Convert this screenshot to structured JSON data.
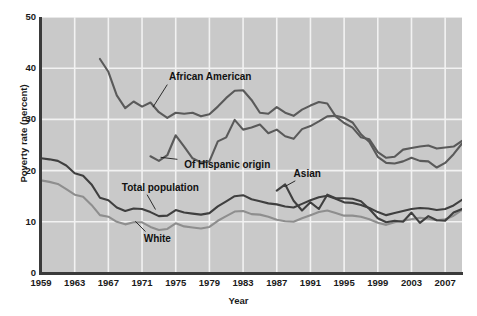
{
  "chart_data": {
    "type": "line",
    "title": "",
    "xlabel": "Year",
    "ylabel": "Poverty rate (percent)",
    "xlim": [
      1959,
      2009
    ],
    "ylim": [
      0,
      50
    ],
    "grid": true,
    "legend_position": "inline-annotations",
    "xticks": [
      1959,
      1963,
      1967,
      1971,
      1975,
      1979,
      1983,
      1987,
      1991,
      1995,
      1999,
      2003,
      2007
    ],
    "yticks": [
      0,
      10,
      20,
      30,
      40,
      50
    ],
    "background_color": "#c9c9c9",
    "gridline_color": "#f2f2f2",
    "series": [
      {
        "name": "African American",
        "color": "#5a5a5a",
        "label_x": 1974.2,
        "label_y": 38.2,
        "x": [
          1966,
          1967,
          1968,
          1969,
          1970,
          1971,
          1972,
          1973,
          1974,
          1975,
          1976,
          1977,
          1978,
          1979,
          1980,
          1981,
          1982,
          1983,
          1984,
          1985,
          1986,
          1987,
          1988,
          1989,
          1990,
          1991,
          1992,
          1993,
          1994,
          1995,
          1996,
          1997,
          1998,
          1999,
          2000,
          2001,
          2002,
          2003,
          2004,
          2005,
          2006,
          2007,
          2008,
          2009
        ],
        "values": [
          41.8,
          39.3,
          34.7,
          32.2,
          33.5,
          32.5,
          33.3,
          31.4,
          30.3,
          31.3,
          31.1,
          31.3,
          30.6,
          31.0,
          32.5,
          34.2,
          35.6,
          35.7,
          33.8,
          31.3,
          31.1,
          32.4,
          31.3,
          30.7,
          31.9,
          32.7,
          33.4,
          33.1,
          30.6,
          29.3,
          28.4,
          26.5,
          26.1,
          23.6,
          22.5,
          22.7,
          24.1,
          24.4,
          24.7,
          24.9,
          24.3,
          24.5,
          24.7,
          25.8
        ]
      },
      {
        "name": "Of Hispanic origin",
        "color": "#5a5a5a",
        "label_x": 1976.0,
        "label_y": 21.0,
        "x": [
          1972,
          1973,
          1974,
          1975,
          1976,
          1977,
          1978,
          1979,
          1980,
          1981,
          1982,
          1983,
          1984,
          1985,
          1986,
          1987,
          1988,
          1989,
          1990,
          1991,
          1992,
          1993,
          1994,
          1995,
          1996,
          1997,
          1998,
          1999,
          2000,
          2001,
          2002,
          2003,
          2004,
          2005,
          2006,
          2007,
          2008,
          2009
        ],
        "values": [
          22.8,
          21.9,
          23.0,
          26.9,
          24.7,
          22.4,
          21.6,
          21.8,
          25.7,
          26.5,
          29.9,
          28.0,
          28.4,
          29.0,
          27.3,
          28.0,
          26.7,
          26.2,
          28.1,
          28.7,
          29.6,
          30.6,
          30.7,
          30.3,
          29.4,
          27.1,
          25.6,
          22.7,
          21.5,
          21.4,
          21.8,
          22.5,
          21.9,
          21.8,
          20.6,
          21.5,
          23.2,
          25.3
        ]
      },
      {
        "name": "Total population",
        "color": "#3f3f3f",
        "label_x": 1968.6,
        "label_y": 16.6,
        "x": [
          1959,
          1960,
          1961,
          1962,
          1963,
          1964,
          1965,
          1966,
          1967,
          1968,
          1969,
          1970,
          1971,
          1972,
          1973,
          1974,
          1975,
          1976,
          1977,
          1978,
          1979,
          1980,
          1981,
          1982,
          1983,
          1984,
          1985,
          1986,
          1987,
          1988,
          1989,
          1990,
          1991,
          1992,
          1993,
          1994,
          1995,
          1996,
          1997,
          1998,
          1999,
          2000,
          2001,
          2002,
          2003,
          2004,
          2005,
          2006,
          2007,
          2008,
          2009
        ],
        "values": [
          22.4,
          22.2,
          21.9,
          21.0,
          19.5,
          19.0,
          17.3,
          14.7,
          14.2,
          12.8,
          12.1,
          12.6,
          12.5,
          11.9,
          11.1,
          11.2,
          12.3,
          11.8,
          11.6,
          11.4,
          11.7,
          13.0,
          14.0,
          15.0,
          15.2,
          14.4,
          14.0,
          13.6,
          13.4,
          13.0,
          12.8,
          13.5,
          14.2,
          14.8,
          15.1,
          14.5,
          13.8,
          13.7,
          13.3,
          12.7,
          11.9,
          11.3,
          11.7,
          12.1,
          12.5,
          12.7,
          12.6,
          12.3,
          12.5,
          13.2,
          14.3
        ]
      },
      {
        "name": "White",
        "color": "#8e8e8e",
        "label_x": 1971.2,
        "label_y": 6.7,
        "x": [
          1959,
          1960,
          1961,
          1962,
          1963,
          1964,
          1965,
          1966,
          1967,
          1968,
          1969,
          1970,
          1971,
          1972,
          1973,
          1974,
          1975,
          1976,
          1977,
          1978,
          1979,
          1980,
          1981,
          1982,
          1983,
          1984,
          1985,
          1986,
          1987,
          1988,
          1989,
          1990,
          1991,
          1992,
          1993,
          1994,
          1995,
          1996,
          1997,
          1998,
          1999,
          2000,
          2001,
          2002,
          2003,
          2004,
          2005,
          2006,
          2007,
          2008,
          2009
        ],
        "values": [
          18.1,
          17.8,
          17.4,
          16.4,
          15.3,
          14.9,
          13.3,
          11.3,
          11.0,
          10.0,
          9.5,
          9.9,
          9.9,
          9.0,
          8.4,
          8.6,
          9.7,
          9.1,
          8.9,
          8.7,
          9.0,
          10.2,
          11.1,
          12.0,
          12.1,
          11.5,
          11.4,
          11.0,
          10.4,
          10.1,
          10.0,
          10.7,
          11.3,
          11.9,
          12.2,
          11.7,
          11.2,
          11.2,
          11.0,
          10.5,
          9.8,
          9.4,
          9.9,
          10.2,
          10.5,
          10.8,
          10.6,
          10.3,
          10.5,
          11.2,
          12.3
        ]
      },
      {
        "name": "Asian",
        "color": "#3f3f3f",
        "label_x": 1989.0,
        "label_y": 19.3,
        "x": [
          1987,
          1988,
          1989,
          1990,
          1991,
          1992,
          1993,
          1994,
          1995,
          1996,
          1997,
          1998,
          1999,
          2000,
          2001,
          2002,
          2003,
          2004,
          2005,
          2006,
          2007,
          2008,
          2009
        ],
        "values": [
          16.1,
          17.3,
          14.1,
          12.2,
          13.8,
          12.5,
          15.3,
          14.6,
          14.6,
          14.5,
          14.0,
          12.5,
          10.7,
          9.9,
          10.2,
          10.0,
          11.8,
          9.8,
          11.1,
          10.3,
          10.2,
          11.8,
          12.5
        ]
      }
    ]
  }
}
